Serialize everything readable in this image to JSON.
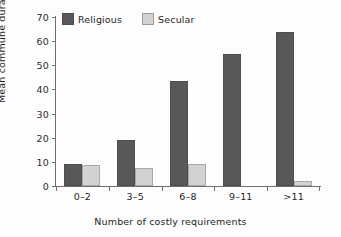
{
  "chart_data": {
    "type": "bar",
    "title": "",
    "subtitle": "",
    "xlabel": "Number of costly requirements",
    "ylabel": "Mean commune duration (years)",
    "categories": [
      "0–2",
      "3–5",
      "6–8",
      "9–11",
      ">11"
    ],
    "series": [
      {
        "name": "Religious",
        "color": "#58585a",
        "values": [
          9.3,
          19.0,
          43.7,
          54.5,
          64.0
        ]
      },
      {
        "name": "Secular",
        "color": "#d2d2d2",
        "values": [
          8.5,
          7.5,
          9.2,
          0,
          2.2
        ]
      }
    ],
    "ylim": [
      0,
      70
    ],
    "yticks": [
      0,
      10,
      20,
      30,
      40,
      50,
      60,
      70
    ],
    "ytick_labels": [
      "0",
      "10",
      "20",
      "30",
      "40",
      "50",
      "60",
      "70"
    ],
    "grid": false,
    "legend_position": "top-left"
  }
}
